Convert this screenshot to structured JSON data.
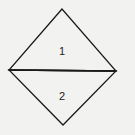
{
  "diagram": {
    "shape": "diamond split horizontally into two triangles",
    "vertices": {
      "top": [
        62,
        9
      ],
      "left": [
        9,
        70
      ],
      "right": [
        116,
        71
      ],
      "bottom": [
        63,
        125
      ]
    },
    "regions": [
      {
        "id": "upper-triangle",
        "label": "1",
        "label_pos": [
          62,
          55
        ]
      },
      {
        "id": "lower-triangle",
        "label": "2",
        "label_pos": [
          62,
          100
        ]
      }
    ],
    "colors": {
      "stroke": "#1a1a1a",
      "background": "#f2f2f0"
    }
  }
}
